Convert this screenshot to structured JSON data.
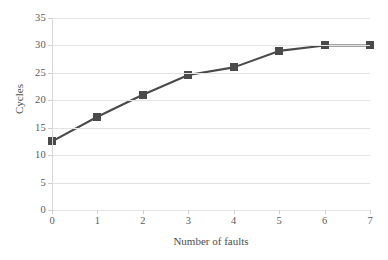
{
  "chart_data": {
    "type": "line",
    "title": "",
    "xlabel": "Number of faults",
    "ylabel": "Cycles",
    "x": [
      0,
      1,
      2,
      3,
      4,
      5,
      6,
      7
    ],
    "values": [
      12.5,
      17,
      21,
      24.6,
      26,
      29,
      30,
      30
    ],
    "series": [
      {
        "name": "Cycles",
        "values": [
          12.5,
          17,
          21,
          24.6,
          26,
          29,
          30,
          30
        ]
      }
    ],
    "xtick_labels": [
      "0",
      "1",
      "2",
      "3",
      "4",
      "5",
      "6",
      "7"
    ],
    "ytick_labels": [
      "0",
      "5",
      "10",
      "15",
      "20",
      "25",
      "30",
      "35"
    ],
    "ytick_values": [
      0,
      5,
      10,
      15,
      20,
      25,
      30,
      35
    ],
    "xlim": [
      0,
      7
    ],
    "ylim": [
      0,
      35
    ],
    "grid": "horizontal",
    "legend": "none",
    "marker": "square",
    "series_color": "#4a4a4a",
    "grid_color": "#e3e3e3",
    "axis_color": "#d6d6d6",
    "tick_label_color": "#5b5b5b",
    "background_color": "#ffffff"
  }
}
